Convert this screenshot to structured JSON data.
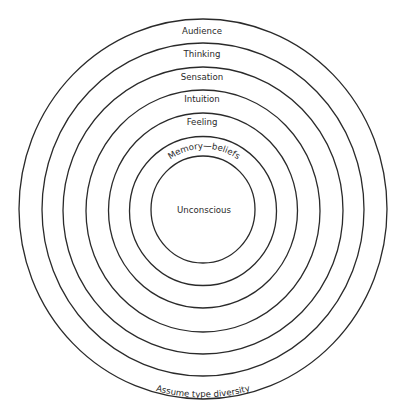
{
  "diagram": {
    "type": "concentric-circles",
    "center": {
      "x": 203,
      "y": 210
    },
    "rings": [
      {
        "label": "Audience",
        "rx": 184,
        "ry": 190
      },
      {
        "label": "Thinking",
        "rx": 161,
        "ry": 166.5
      },
      {
        "label": "Sensation",
        "rx": 140,
        "ry": 143.5
      },
      {
        "label": "Intuition",
        "rx": 117,
        "ry": 121
      },
      {
        "label": "Feeling",
        "rx": 94.5,
        "ry": 97.5
      },
      {
        "label": "Memory—beliefs",
        "rx": 73.5,
        "ry": 74.5
      },
      {
        "label": "Unconscious",
        "rx": 52,
        "ry": 53.5
      }
    ],
    "bottom_label": "Assume type diversity",
    "stroke_color": "#2a2a2a",
    "background": "#ffffff"
  }
}
